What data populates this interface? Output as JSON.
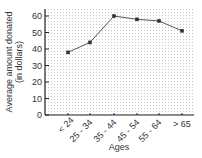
{
  "chart_data": {
    "type": "line",
    "title": "",
    "xlabel": "Ages",
    "ylabel": "Average amount donated (in dollars)",
    "ylabel_lines": [
      "Average amount donated",
      "(in dollars)"
    ],
    "categories": [
      "< 24",
      "25 - 34",
      "35 - 44",
      "45 - 54",
      "55 - 64",
      "> 65"
    ],
    "values": [
      38,
      44,
      60,
      58,
      57,
      51
    ],
    "ylim": [
      0,
      60
    ],
    "yticks": [
      "0",
      "10",
      "20",
      "30",
      "40",
      "50",
      "60"
    ],
    "grid": true,
    "legend": "none",
    "colors": {
      "line": "#555555",
      "marker": "#333333",
      "axis": "#222222",
      "grid": "#cfcfcf"
    }
  }
}
